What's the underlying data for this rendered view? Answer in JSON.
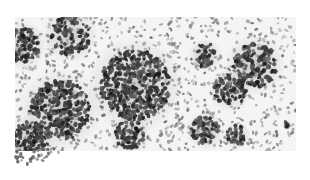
{
  "image": {
    "kind": "histology-micrograph",
    "colormode": "grayscale",
    "description": "Grayscale microscopy of tissue with dense clusters of dark-stained nuclei scattered over lighter stroma",
    "bounds": {
      "x": 15,
      "y": 17,
      "width": 281,
      "height": 134
    },
    "colors": {
      "background": "#ffffff",
      "stroma": "#e6e6e6",
      "nucleus_dark": "#1e1e1e",
      "nucleus_mid": "#6a6a6a"
    },
    "clusters": [
      {
        "x": 22,
        "y": 45,
        "r": 18,
        "density": 0.9
      },
      {
        "x": 70,
        "y": 35,
        "r": 20,
        "density": 0.7
      },
      {
        "x": 60,
        "y": 110,
        "r": 30,
        "density": 0.95
      },
      {
        "x": 30,
        "y": 140,
        "r": 18,
        "density": 0.9
      },
      {
        "x": 135,
        "y": 85,
        "r": 35,
        "density": 1.0
      },
      {
        "x": 130,
        "y": 135,
        "r": 15,
        "density": 0.9
      },
      {
        "x": 205,
        "y": 55,
        "r": 12,
        "density": 0.9
      },
      {
        "x": 230,
        "y": 90,
        "r": 16,
        "density": 0.9
      },
      {
        "x": 205,
        "y": 130,
        "r": 14,
        "density": 0.85
      },
      {
        "x": 255,
        "y": 65,
        "r": 22,
        "density": 0.9
      },
      {
        "x": 237,
        "y": 135,
        "r": 10,
        "density": 0.9
      },
      {
        "x": 287,
        "y": 125,
        "r": 4,
        "density": 1.0
      }
    ]
  }
}
